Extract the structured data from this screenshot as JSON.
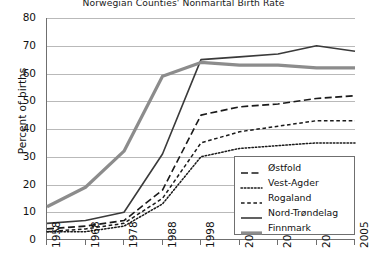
{
  "chart_data": {
    "type": "line",
    "title": "Norwegian Counties' Nonmarital Birth Rate",
    "xlabel": "",
    "ylabel": "Percent of births",
    "categories": [
      "1958",
      "1968",
      "1978",
      "1988",
      "1998",
      "2002",
      "2003",
      "2004",
      "2005"
    ],
    "ylim": [
      0,
      80
    ],
    "ytick_step": 10,
    "yticks": [
      "0",
      "10",
      "20",
      "30",
      "40",
      "50",
      "60",
      "70",
      "80"
    ],
    "grid": "horizontal",
    "legend_position": "bottom-right",
    "series": [
      {
        "name": "Østfold",
        "style": "long-dash",
        "color": "#1a1a1a",
        "width": 1.6,
        "values": [
          4,
          5,
          7,
          18,
          45,
          48,
          49,
          51,
          52
        ]
      },
      {
        "name": "Vest-Agder",
        "style": "dotted",
        "color": "#1a1a1a",
        "width": 1.5,
        "values": [
          3,
          3,
          5,
          13,
          30,
          33,
          34,
          35,
          35
        ]
      },
      {
        "name": "Rogaland",
        "style": "short-dash",
        "color": "#1a1a1a",
        "width": 1.5,
        "values": [
          3,
          4,
          6,
          15,
          35,
          39,
          41,
          43,
          43
        ]
      },
      {
        "name": "Nord-Trøndelag",
        "style": "solid",
        "color": "#3a3a3a",
        "width": 1.6,
        "values": [
          6,
          7,
          10,
          31,
          65,
          66,
          67,
          70,
          68
        ]
      },
      {
        "name": "Finnmark",
        "style": "solid-thick",
        "color": "#8c8c8c",
        "width": 3.2,
        "values": [
          12,
          19,
          32,
          59,
          64,
          63,
          63,
          62,
          62
        ]
      }
    ]
  }
}
